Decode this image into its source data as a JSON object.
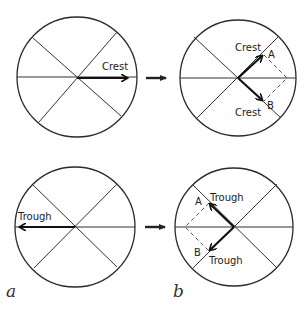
{
  "diagram": {
    "panels": {
      "a_top": {
        "label": "Crest"
      },
      "b_top": {
        "label_a": "Crest",
        "label_b": "Crest",
        "point_a": "A",
        "point_b": "B"
      },
      "a_bottom": {
        "label": "Trough"
      },
      "b_bottom": {
        "label_a": "Trough",
        "label_b": "Trough",
        "point_a": "A",
        "point_b": "B"
      }
    },
    "column_labels": {
      "left": "a",
      "right": "b"
    },
    "colors": {
      "stroke": "#2a2a2a",
      "vector": "#111111",
      "dashed": "#555555"
    }
  }
}
